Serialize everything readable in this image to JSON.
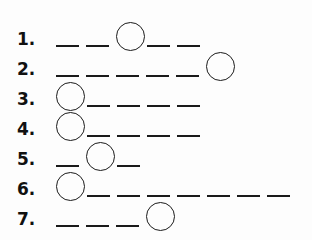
{
  "worksheet": {
    "items": [
      {
        "number": "1.",
        "blanks": 5,
        "circled_position": 3
      },
      {
        "number": "2.",
        "blanks": 6,
        "circled_position": 6
      },
      {
        "number": "3.",
        "blanks": 5,
        "circled_position": 1
      },
      {
        "number": "4.",
        "blanks": 5,
        "circled_position": 1
      },
      {
        "number": "5.",
        "blanks": 3,
        "circled_position": 2
      },
      {
        "number": "6.",
        "blanks": 8,
        "circled_position": 1
      },
      {
        "number": "7.",
        "blanks": 4,
        "circled_position": 4
      }
    ]
  },
  "colors": {
    "ink": "#1a1a1a",
    "background": "#fdfdfd"
  }
}
